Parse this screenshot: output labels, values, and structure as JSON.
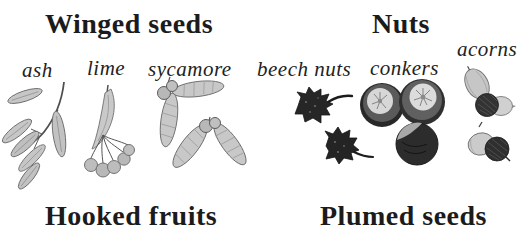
{
  "page": {
    "background_color": "#ffffff",
    "ink_color": "#1b1b1b",
    "pencil_light_gray": "#c6c6c6",
    "pencil_dark_gray": "#262626"
  },
  "sections": {
    "winged_seeds": {
      "title": "Winged seeds",
      "items": [
        {
          "label": "ash",
          "illustration": "ash-winged-seed-spray"
        },
        {
          "label": "lime",
          "illustration": "lime-bract-with-round-fruits"
        },
        {
          "label": "sycamore",
          "illustration": "sycamore-paired-samaras"
        }
      ]
    },
    "nuts": {
      "title": "Nuts",
      "items": [
        {
          "label": "beech nuts",
          "illustration": "spiky-beech-nut-husks"
        },
        {
          "label": "conkers",
          "illustration": "conker-horse-chestnuts"
        },
        {
          "label": "acorns",
          "illustration": "acorns-with-cups"
        }
      ]
    },
    "hooked_fruits": {
      "title": "Hooked fruits"
    },
    "plumed_seeds": {
      "title": "Plumed seeds"
    }
  }
}
